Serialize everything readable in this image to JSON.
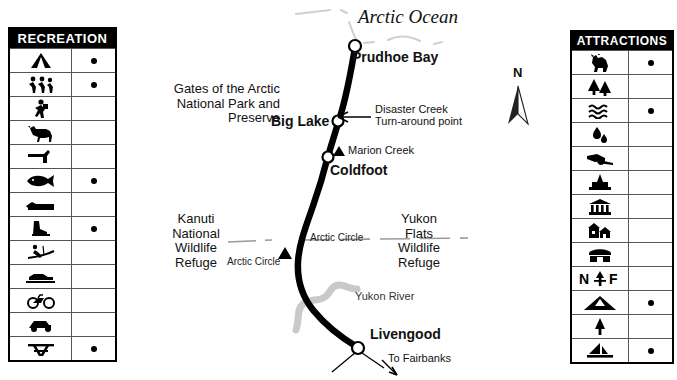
{
  "legends": {
    "recreation": {
      "title": "RECREATION",
      "rows": [
        {
          "icon": "camping-icon",
          "label": "Camping",
          "dot": true
        },
        {
          "icon": "hiking-icon",
          "label": "Hiking",
          "dot": true
        },
        {
          "icon": "backpacking-icon",
          "label": "Backpacking",
          "dot": false
        },
        {
          "icon": "horseback-riding-icon",
          "label": "Horseback Riding",
          "dot": false
        },
        {
          "icon": "hunting-icon",
          "label": "Hunting",
          "dot": false
        },
        {
          "icon": "fishing-icon",
          "label": "Fishing",
          "dot": true
        },
        {
          "icon": "boating-icon",
          "label": "Boating",
          "dot": false
        },
        {
          "icon": "ice-skating-icon",
          "label": "Ice Skating",
          "dot": true
        },
        {
          "icon": "skiing-icon",
          "label": "Skiing",
          "dot": false
        },
        {
          "icon": "snowmobiling-icon",
          "label": "Snowmobiling",
          "dot": false
        },
        {
          "icon": "bicycling-icon",
          "label": "Bicycling",
          "dot": false
        },
        {
          "icon": "off-road-vehicle-icon",
          "label": "Off-Road Vehicle",
          "dot": false
        },
        {
          "icon": "picnicking-icon",
          "label": "Picnicking",
          "dot": true
        }
      ]
    },
    "attractions": {
      "title": "ATTRACTIONS",
      "rows": [
        {
          "icon": "wildlife-viewing-icon",
          "label": "Wildlife Viewing",
          "dot": true
        },
        {
          "icon": "forest-icon",
          "label": "Forest",
          "dot": false
        },
        {
          "icon": "hot-springs-icon",
          "label": "Hot Springs",
          "dot": true
        },
        {
          "icon": "oil-drops-icon",
          "label": "Oil",
          "dot": false
        },
        {
          "icon": "cannon-icon",
          "label": "Historic Site",
          "dot": false
        },
        {
          "icon": "oil-well-icon",
          "label": "Oil Well",
          "dot": false
        },
        {
          "icon": "museum-icon",
          "label": "Museum",
          "dot": false
        },
        {
          "icon": "historic-houses-icon",
          "label": "Historic Houses",
          "dot": false
        },
        {
          "icon": "mine-icon",
          "label": "Mine",
          "dot": false
        },
        {
          "icon": "national-forest-icon",
          "label": "National Forest",
          "dot": false
        },
        {
          "icon": "mountain-icon",
          "label": "Mountain",
          "dot": true
        },
        {
          "icon": "tree-icon",
          "label": "Tree",
          "dot": false
        },
        {
          "icon": "sailboat-icon",
          "label": "Sailing",
          "dot": true
        }
      ]
    }
  },
  "map": {
    "ocean_label": "Arctic Ocean",
    "cities": [
      {
        "name": "Prudhoe Bay"
      },
      {
        "name": "Big Lake"
      },
      {
        "name": "Coldfoot"
      },
      {
        "name": "Livengood"
      }
    ],
    "areas": [
      {
        "name": "Gates of the Arctic\nNational Park and\nPreserve"
      },
      {
        "name": "Kanuti\nNational\nWildlife\nRefuge"
      },
      {
        "name": "Yukon\nFlats\nWildlife\nRefuge"
      }
    ],
    "annotations": {
      "disaster_creek": "Disaster Creek\nTurn-around point",
      "marion_creek": "Marion Creek",
      "arctic_circle_left": "Arctic Circle",
      "arctic_circle_right": "Arctic Circle",
      "yukon_river": "Yukon River",
      "to_fairbanks": "To Fairbanks"
    },
    "compass": {
      "north": "N"
    }
  },
  "colors": {
    "highway": "#000000",
    "river": "#c9c9c9",
    "coastline": "#cfcfcf",
    "arctic_circle": "#9a9a9a",
    "legend_header_bg": "#000000",
    "legend_header_text": "#ffffff"
  }
}
